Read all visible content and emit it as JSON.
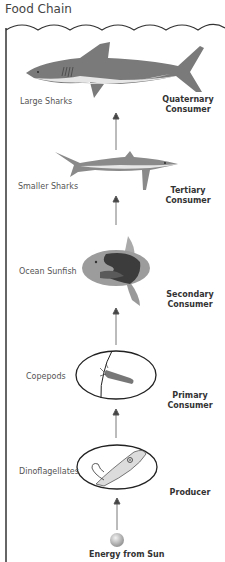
{
  "title": "Food Chain",
  "levels": [
    {
      "organism": "Large Sharks",
      "role_line1": "Quaternary",
      "role_line2": "Consumer"
    },
    {
      "organism": "Smaller Sharks",
      "role_line1": "Tertiary",
      "role_line2": "Consumer"
    },
    {
      "organism": "Ocean Sunfish",
      "role_line1": "Secondary",
      "role_line2": "Consumer"
    },
    {
      "organism": "Copepods",
      "role_line1": "Primary",
      "role_line2": "Consumer"
    },
    {
      "organism": "Dinoflagellates",
      "role_line1": "Producer",
      "role_line2": ""
    }
  ],
  "energy_source": "Energy from Sun",
  "colors": {
    "shark_dark": "#777777",
    "shark_belly": "#e4e4e4",
    "sunfish_body": "#9a9a9a",
    "sunfish_dark": "#444444",
    "line": "#222222",
    "sun": "#b8b8b8"
  }
}
